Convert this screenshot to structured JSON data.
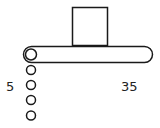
{
  "diagram": {
    "left_label": "5",
    "right_label": "35",
    "stroke_color": "#1a1a1a",
    "background": "#ffffff",
    "block": {
      "shape": "square"
    },
    "bar": {
      "shape": "rounded-rod"
    },
    "chain": {
      "circle_count": 5
    }
  }
}
